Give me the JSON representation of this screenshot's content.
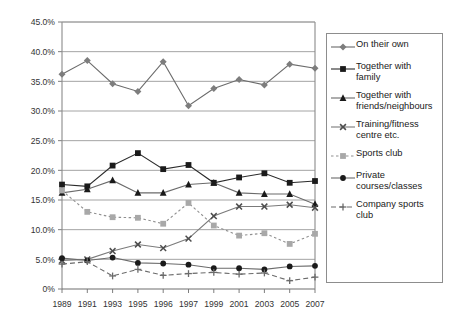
{
  "chart_data": {
    "type": "line",
    "title": "",
    "subtitle": "",
    "xlabel": "",
    "ylabel": "",
    "categories": [
      "1989",
      "1991",
      "1993",
      "1995",
      "1996",
      "1997",
      "1999",
      "2001",
      "2003",
      "2005",
      "2007"
    ],
    "ylim": [
      0,
      45
    ],
    "ytick_labels": [
      "0%",
      "5.0%",
      "10.0%",
      "15.0%",
      "20.0%",
      "25.0%",
      "30.0%",
      "35.0%",
      "40.0%",
      "45.0%"
    ],
    "ytick_values": [
      0,
      5,
      10,
      15,
      20,
      25,
      30,
      35,
      40,
      45
    ],
    "grid": "horizontal",
    "legend_position": "right",
    "value_unit": "%",
    "series": [
      {
        "name": "On their own",
        "marker": "diamond",
        "color": "#7d7d7d",
        "line_color": "#6b6b6b",
        "line_style": "solid",
        "values": [
          36.2,
          38.5,
          34.6,
          33.3,
          38.3,
          30.9,
          33.8,
          35.3,
          34.4,
          37.9,
          37.2
        ]
      },
      {
        "name": "Together with family",
        "marker": "square",
        "color": "#1a1a1a",
        "line_color": "#2b2b2b",
        "line_style": "solid",
        "values": [
          17.6,
          17.3,
          20.8,
          22.9,
          20.2,
          20.9,
          17.9,
          18.8,
          19.5,
          17.9,
          18.2
        ]
      },
      {
        "name": "Together with friends/neighbours",
        "marker": "triangle",
        "color": "#1a1a1a",
        "line_color": "#6b6b6b",
        "line_style": "solid",
        "values": [
          16.2,
          16.8,
          18.3,
          16.2,
          16.2,
          17.6,
          17.9,
          16.2,
          16.0,
          16.0,
          14.3
        ]
      },
      {
        "name": "Training/fitness centre etc.",
        "marker": "x",
        "color": "#4d4d4d",
        "line_color": "#7a7a7a",
        "line_style": "solid",
        "values": [
          4.8,
          5.0,
          6.4,
          7.5,
          6.9,
          8.5,
          12.3,
          13.9,
          13.9,
          14.2,
          13.7
        ]
      },
      {
        "name": "Sports club",
        "marker": "square",
        "color": "#a8a8a8",
        "line_color": "#8f8f8f",
        "line_style": "dotted",
        "values": [
          16.6,
          13.0,
          12.1,
          12.0,
          11.0,
          14.5,
          10.7,
          9.0,
          9.4,
          7.6,
          9.3
        ]
      },
      {
        "name": "Private courses/classes",
        "marker": "circle",
        "color": "#1a1a1a",
        "line_color": "#6b6b6b",
        "line_style": "solid",
        "values": [
          5.2,
          4.8,
          5.3,
          4.4,
          4.3,
          4.1,
          3.5,
          3.5,
          3.3,
          3.8,
          3.9
        ]
      },
      {
        "name": "Company sports club",
        "marker": "plus",
        "color": "#6b6b6b",
        "line_color": "#6b6b6b",
        "line_style": "dashed",
        "values": [
          4.2,
          4.6,
          2.2,
          3.3,
          2.3,
          2.6,
          2.8,
          2.5,
          2.7,
          1.4,
          2.0
        ]
      }
    ]
  },
  "legend": {
    "items": [
      {
        "label": "On their own"
      },
      {
        "label": "Together with\nfamily"
      },
      {
        "label": "Together with\nfriends/neighbours"
      },
      {
        "label": "Training/fitness\ncentre etc."
      },
      {
        "label": "Sports club"
      },
      {
        "label": "Private\ncourses/classes"
      },
      {
        "label": "Company sports\nclub"
      }
    ]
  }
}
